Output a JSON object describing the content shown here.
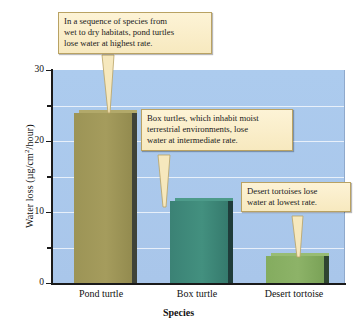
{
  "chart_data": {
    "type": "bar",
    "title": "",
    "categories": [
      "Pond turtle",
      "Box turtle",
      "Desert tortoise"
    ],
    "values": [
      24.0,
      11.5,
      3.8
    ],
    "xlabel": "Species",
    "ylabel": "Water loss (µg/cm²/hour)",
    "ylim": [
      0,
      30
    ],
    "yticks": [
      0,
      10,
      20,
      30
    ],
    "yminorticks": [
      5,
      15,
      25
    ],
    "grid": true,
    "legend": "none",
    "bar_colors": [
      "#9a9254",
      "#3c8376",
      "#83ab5e"
    ],
    "plot_background": "#a9c6ea",
    "annotations": [
      "In a sequence of species from wet to dry habitats, pond turtles lose water at highest rate.",
      "Box turtles, which inhabit moist terrestrial environments, lose water at intermediate rate.",
      "Desert tortoises lose water at lowest rate."
    ]
  },
  "axes": {
    "y_title_main": "Water loss (µg/cm",
    "y_title_sup": "2",
    "y_title_tail": "/hour)",
    "x_title": "Species",
    "y_tick_labels": [
      "30",
      "20",
      "10",
      "0"
    ],
    "x_tick_labels": [
      "Pond turtle",
      "Box turtle",
      "Desert tortoise"
    ]
  },
  "callouts": {
    "pond": {
      "line1": "In a sequence of species from",
      "line2": "wet to dry habitats, pond turtles",
      "line3": "lose water at highest rate."
    },
    "box": {
      "line1": "Box turtles, which inhabit moist",
      "line2": "terrestrial environments, lose",
      "line3": "water at intermediate rate."
    },
    "desert": {
      "line1": "Desert tortoises lose",
      "line2": "water at lowest rate."
    }
  }
}
